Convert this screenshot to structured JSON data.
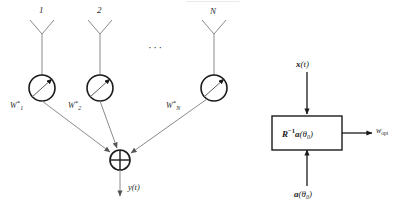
{
  "figure": {
    "title_fragment": "—————————",
    "ellipsis": "···"
  },
  "array": {
    "antennas": [
      {
        "id": "antenna-1",
        "label": "1",
        "x": 42,
        "weight": {
          "base": "W",
          "sub": "1",
          "sup": "*"
        }
      },
      {
        "id": "antenna-2",
        "label": "2",
        "x": 100,
        "weight": {
          "base": "W",
          "sub": "2",
          "sup": "*"
        }
      },
      {
        "id": "antenna-n",
        "label": "N",
        "x": 214,
        "weight": {
          "base": "W",
          "sub": "N",
          "sup": "*"
        }
      }
    ],
    "summer": {
      "name": "summing-junction",
      "symbol": "⊕"
    },
    "output": {
      "label": "y(t)"
    }
  },
  "weights_block": {
    "input_top": {
      "base": "x",
      "arg": "(t)"
    },
    "input_bottom": {
      "base": "a",
      "arg": "(θ",
      "sub": "0",
      "close": ")"
    },
    "block_label": {
      "base": "R",
      "sup": "−1",
      "vec": "a",
      "arg": "(θ",
      "sub": "0",
      "close": ")"
    },
    "output_label": {
      "base": "w",
      "sub": "opt"
    }
  },
  "colors": {
    "line": "#6b6b6b",
    "stroke_dark": "#1a1a1a",
    "text": "#2b2b2b",
    "background": "#ffffff"
  }
}
